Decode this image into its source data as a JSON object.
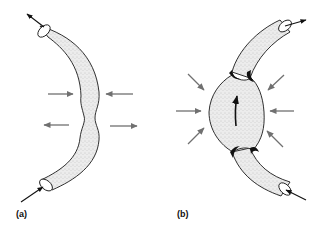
{
  "figure": {
    "panels": [
      {
        "label": "(a)",
        "description": "Curved tube with a narrowed waist; inward arrows at top pair, outward arrows at bottom pair; flow arrows at both open ends",
        "force_arrows": [
          {
            "direction": "right",
            "side": "left",
            "row": "upper"
          },
          {
            "direction": "left",
            "side": "right",
            "row": "upper"
          },
          {
            "direction": "left",
            "side": "left",
            "row": "lower"
          },
          {
            "direction": "right",
            "side": "right",
            "row": "lower"
          }
        ],
        "flow_arrows": [
          "in-bottom",
          "out-top"
        ]
      },
      {
        "label": "(b)",
        "description": "Curved tube with a bulged central chamber; eight radial inward-pointing arrows; internal upward flow arrow; flow arrows at both open ends",
        "force_arrows_count": 8,
        "flow_arrows": [
          "in-bottom",
          "out-top",
          "internal-up"
        ]
      }
    ],
    "colors": {
      "outline": "#1a1a1a",
      "tube_fill": "#e6e6e6",
      "stipple": "#9a9a9a",
      "force_arrow": "#707070",
      "background": "#ffffff"
    }
  }
}
